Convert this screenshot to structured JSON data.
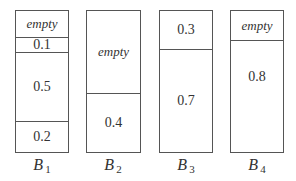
{
  "bins": [
    {
      "name": "B",
      "subscript": "1",
      "segments": [
        {
          "label": "empty",
          "type": "empty"
        },
        {
          "label": "0.1",
          "type": "value"
        },
        {
          "label": "0.5",
          "type": "value"
        },
        {
          "label": "0.2",
          "type": "value"
        }
      ]
    },
    {
      "name": "B",
      "subscript": "2",
      "segments": [
        {
          "label": "empty",
          "type": "empty"
        },
        {
          "label": "0.4",
          "type": "value"
        }
      ]
    },
    {
      "name": "B",
      "subscript": "3",
      "segments": [
        {
          "label": "0.3",
          "type": "value"
        },
        {
          "label": "0.7",
          "type": "value"
        }
      ]
    },
    {
      "name": "B",
      "subscript": "4",
      "segments": [
        {
          "label": "empty",
          "type": "empty"
        },
        {
          "label": "0.8",
          "type": "value"
        }
      ]
    }
  ]
}
